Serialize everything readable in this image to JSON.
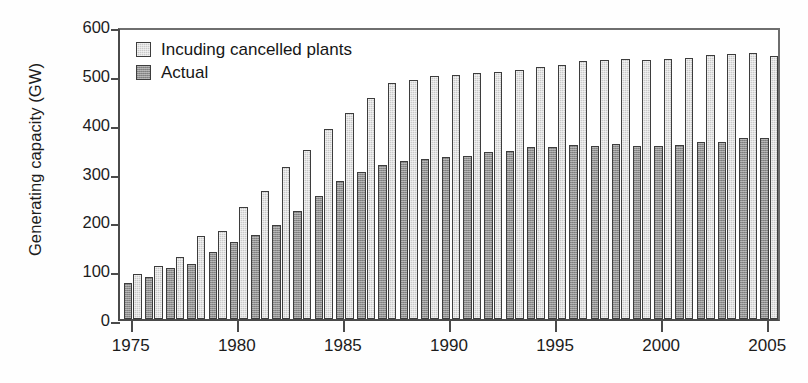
{
  "chart_data": {
    "type": "bar",
    "title": "",
    "xlabel": "",
    "ylabel": "Generating capacity (GW)",
    "xlim": [
      1974.4,
      2005.6
    ],
    "ylim": [
      0,
      600
    ],
    "yticks": [
      0,
      100,
      200,
      300,
      400,
      500,
      600
    ],
    "xticks": [
      1975,
      1980,
      1985,
      1990,
      1995,
      2000,
      2005
    ],
    "grid": false,
    "legend_position": "top-left",
    "legend": [
      "Incuding cancelled plants",
      "Actual"
    ],
    "categories": [
      1975,
      1976,
      1977,
      1978,
      1979,
      1980,
      1981,
      1982,
      1983,
      1984,
      1985,
      1986,
      1987,
      1988,
      1989,
      1990,
      1991,
      1992,
      1993,
      1994,
      1995,
      1996,
      1997,
      1998,
      1999,
      2000,
      2001,
      2002,
      2003,
      2004,
      2005
    ],
    "series": [
      {
        "name": "Incuding cancelled plants",
        "color": "#c9c9c9",
        "values": [
          92,
          108,
          128,
          170,
          180,
          230,
          262,
          311,
          347,
          389,
          421,
          453,
          483,
          489,
          497,
          500,
          503,
          506,
          509,
          516,
          521,
          529,
          531,
          532,
          531,
          533,
          535,
          541,
          543,
          544,
          539
        ]
      },
      {
        "name": "Actual",
        "color": "#8e8e8e",
        "values": [
          74,
          86,
          105,
          112,
          138,
          158,
          172,
          192,
          222,
          252,
          282,
          302,
          316,
          324,
          328,
          331,
          333,
          343,
          345,
          353,
          352,
          356,
          354,
          358,
          354,
          355,
          357,
          362,
          363,
          370,
          371
        ]
      }
    ]
  },
  "axis": {
    "ylabel": "Generating capacity (GW)",
    "ytick_labels": [
      "600",
      "500",
      "400",
      "300",
      "200",
      "100",
      "0"
    ],
    "xtick_labels": [
      "1975",
      "1980",
      "1985",
      "1990",
      "1995",
      "2000",
      "2005"
    ]
  },
  "legend": {
    "items": [
      {
        "label": "Incuding cancelled plants",
        "swatch": "total"
      },
      {
        "label": "Actual",
        "swatch": "actual"
      }
    ]
  }
}
